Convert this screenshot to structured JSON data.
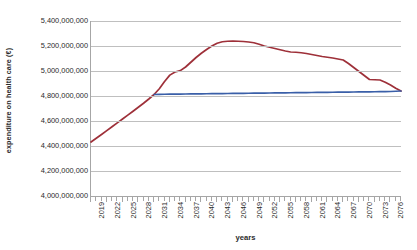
{
  "chart_data": {
    "type": "line",
    "title": "",
    "xlabel": "years",
    "ylabel": "expenditure on health care (€)",
    "ylim": [
      4000000000,
      5400000000
    ],
    "xlim": [
      2019,
      2078
    ],
    "grid": true,
    "legend": "none",
    "y_ticks": [
      "5,400,000,000",
      "5,200,000,000",
      "5,000,000,000",
      "4,800,000,000",
      "4,600,000,000",
      "4,400,000,000",
      "4,200,000,000",
      "4,000,000,000"
    ],
    "y_tick_values": [
      5400000000,
      5200000000,
      5000000000,
      4800000000,
      4600000000,
      4400000000,
      4200000000,
      4000000000
    ],
    "x_tick_labels": [
      "2019",
      "2022",
      "2025",
      "2028",
      "2031",
      "2034",
      "2037",
      "2040",
      "2043",
      "2046",
      "2049",
      "2052",
      "2055",
      "2058",
      "2061",
      "2064",
      "2067",
      "2070",
      "2073",
      "2076"
    ],
    "x_tick_values": [
      2019,
      2022,
      2025,
      2028,
      2031,
      2034,
      2037,
      2040,
      2043,
      2046,
      2049,
      2052,
      2055,
      2058,
      2061,
      2064,
      2067,
      2070,
      2073,
      2076
    ],
    "x_minor_step": 1,
    "colors": {
      "series_1": "#9E3039",
      "series_2": "#3A5FA8",
      "gridline": "#BFBFBF",
      "axis": "#A6A6A6",
      "text": "#2B2B2B",
      "background": "#FFFFFF"
    },
    "series": [
      {
        "name": "series_1",
        "color": "#9E3039",
        "x": [
          2019,
          2020,
          2021,
          2022,
          2023,
          2024,
          2025,
          2026,
          2027,
          2028,
          2029,
          2030,
          2031,
          2032,
          2033,
          2034,
          2035,
          2036,
          2037,
          2038,
          2039,
          2040,
          2041,
          2042,
          2043,
          2044,
          2045,
          2046,
          2047,
          2048,
          2049,
          2050,
          2051,
          2052,
          2053,
          2054,
          2055,
          2056,
          2057,
          2058,
          2059,
          2060,
          2061,
          2062,
          2063,
          2064,
          2065,
          2066,
          2067,
          2068,
          2069,
          2070,
          2071,
          2072,
          2073,
          2074,
          2075,
          2076,
          2077,
          2078
        ],
        "values": [
          4432000000,
          4462000000,
          4492000000,
          4523000000,
          4554000000,
          4585000000,
          4616000000,
          4647000000,
          4678000000,
          4710000000,
          4742000000,
          4776000000,
          4812000000,
          4858000000,
          4916000000,
          4967000000,
          4992000000,
          5003000000,
          5032000000,
          5070000000,
          5108000000,
          5142000000,
          5172000000,
          5200000000,
          5222000000,
          5234000000,
          5238000000,
          5239000000,
          5238000000,
          5236000000,
          5232000000,
          5226000000,
          5214000000,
          5200000000,
          5190000000,
          5180000000,
          5170000000,
          5160000000,
          5152000000,
          5150000000,
          5146000000,
          5140000000,
          5132000000,
          5124000000,
          5116000000,
          5110000000,
          5104000000,
          5096000000,
          5088000000,
          5060000000,
          5028000000,
          4996000000,
          4964000000,
          4932000000,
          4930000000,
          4928000000,
          4910000000,
          4888000000,
          4862000000,
          4840000000
        ]
      },
      {
        "name": "series_2",
        "color": "#3A5FA8",
        "x": [
          2031,
          2032,
          2033,
          2034,
          2035,
          2036,
          2037,
          2038,
          2039,
          2040,
          2041,
          2042,
          2043,
          2044,
          2045,
          2046,
          2047,
          2048,
          2049,
          2050,
          2051,
          2052,
          2053,
          2054,
          2055,
          2056,
          2057,
          2058,
          2059,
          2060,
          2061,
          2062,
          2063,
          2064,
          2065,
          2066,
          2067,
          2068,
          2069,
          2070,
          2071,
          2072,
          2073,
          2074,
          2075,
          2076,
          2077,
          2078
        ],
        "values": [
          4812000000,
          4813000000,
          4814000000,
          4814500000,
          4815000000,
          4815500000,
          4816000000,
          4816500000,
          4817000000,
          4817500000,
          4818000000,
          4818500000,
          4819000000,
          4819500000,
          4820000000,
          4820500000,
          4821000000,
          4821500000,
          4822000000,
          4822500000,
          4823000000,
          4823500000,
          4824000000,
          4824500000,
          4825000000,
          4825500000,
          4826000000,
          4826500000,
          4827000000,
          4827500000,
          4828000000,
          4828500000,
          4829000000,
          4829500000,
          4830000000,
          4830500000,
          4831000000,
          4831500000,
          4832000000,
          4832500000,
          4833000000,
          4833500000,
          4834000000,
          4834500000,
          4835000000,
          4836000000,
          4838000000,
          4840000000
        ]
      }
    ]
  }
}
